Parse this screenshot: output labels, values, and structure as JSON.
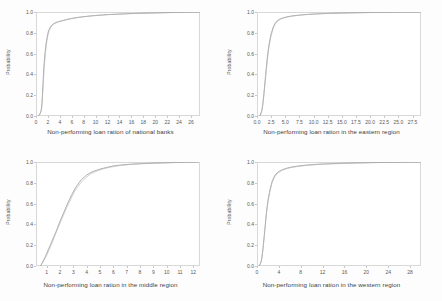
{
  "figure": {
    "background_color": "#fdfdfd",
    "panel_background_color": "#ffffff",
    "axis_color": "#d8d8d8",
    "curve_color": "#8a8a8a",
    "layout": "2x2 grid of cumulative distribution plots"
  },
  "chart_data": [
    {
      "type": "line",
      "title": "",
      "xlabel": "Non-performing loan ration of national banks",
      "ylabel": "Probability",
      "xlim": [
        0,
        27.5
      ],
      "ylim": [
        0.0,
        1.0
      ],
      "grid": false,
      "legend": "none",
      "xticks": [
        "0",
        "2",
        "4",
        "6",
        "8",
        "10",
        "12",
        "14",
        "16",
        "18",
        "20",
        "22",
        "24",
        "26"
      ],
      "xtick_values": [
        0,
        2,
        4,
        6,
        8,
        10,
        12,
        14,
        16,
        18,
        20,
        22,
        24,
        26
      ],
      "yticks": [
        "0.0",
        "0.2",
        "0.4",
        "0.6",
        "0.8",
        "1.0"
      ],
      "ytick_values": [
        0.0,
        0.2,
        0.4,
        0.6,
        0.8,
        1.0
      ],
      "series": [
        {
          "name": "empirical-cdf",
          "x": [
            0.4,
            0.7,
            0.9,
            1.0,
            1.1,
            1.2,
            1.3,
            1.5,
            1.7,
            1.9,
            2.1,
            2.4,
            2.7,
            3.0,
            3.4,
            3.8,
            4.3,
            5.0,
            6.0,
            7.0,
            8.5,
            10.0,
            12.0,
            14.0,
            16.0,
            18.0,
            20.0,
            22.0,
            24.0,
            26.0,
            27.5
          ],
          "y": [
            0.0,
            0.02,
            0.06,
            0.12,
            0.22,
            0.34,
            0.46,
            0.6,
            0.7,
            0.77,
            0.82,
            0.855,
            0.875,
            0.89,
            0.9,
            0.908,
            0.915,
            0.925,
            0.938,
            0.948,
            0.958,
            0.966,
            0.975,
            0.98,
            0.985,
            0.988,
            0.991,
            0.994,
            0.996,
            0.999,
            1.0
          ]
        },
        {
          "name": "fitted-cdf",
          "x": [
            0.4,
            0.8,
            1.0,
            1.2,
            1.4,
            1.6,
            1.9,
            2.2,
            2.6,
            3.1,
            3.7,
            4.4,
            5.3,
            6.5,
            8.0,
            10.0,
            12.5,
            15.0,
            18.0,
            21.0,
            24.0,
            27.5
          ],
          "y": [
            0.0,
            0.04,
            0.1,
            0.3,
            0.48,
            0.62,
            0.75,
            0.82,
            0.865,
            0.888,
            0.903,
            0.916,
            0.929,
            0.943,
            0.955,
            0.967,
            0.976,
            0.983,
            0.989,
            0.993,
            0.997,
            1.0
          ]
        }
      ]
    },
    {
      "type": "line",
      "title": "",
      "xlabel": "Non-performing loan ration in the eastern region",
      "ylabel": "Probability",
      "xlim": [
        0.0,
        29.0
      ],
      "ylim": [
        0.0,
        1.0
      ],
      "grid": false,
      "legend": "none",
      "xticks": [
        "0.0",
        "2.5",
        "5.0",
        "7.5",
        "10.0",
        "12.5",
        "15.0",
        "17.5",
        "20.0",
        "22.5",
        "25.0",
        "27.5"
      ],
      "xtick_values": [
        0.0,
        2.5,
        5.0,
        7.5,
        10.0,
        12.5,
        15.0,
        17.5,
        20.0,
        22.5,
        25.0,
        27.5
      ],
      "yticks": [
        "0.0",
        "0.2",
        "0.4",
        "0.6",
        "0.8",
        "1.0"
      ],
      "ytick_values": [
        0.0,
        0.2,
        0.4,
        0.6,
        0.8,
        1.0
      ],
      "series": [
        {
          "name": "empirical-cdf",
          "x": [
            0.5,
            0.8,
            1.0,
            1.2,
            1.5,
            1.8,
            2.1,
            2.5,
            2.9,
            3.3,
            3.8,
            4.4,
            5.2,
            6.2,
            7.5,
            9.0,
            11.0,
            13.0,
            15.0,
            18.0,
            21.0,
            24.0,
            27.0,
            29.0
          ],
          "y": [
            0.0,
            0.04,
            0.1,
            0.2,
            0.38,
            0.55,
            0.68,
            0.79,
            0.86,
            0.9,
            0.925,
            0.94,
            0.952,
            0.962,
            0.97,
            0.977,
            0.983,
            0.987,
            0.99,
            0.993,
            0.996,
            0.998,
            0.999,
            1.0
          ]
        },
        {
          "name": "fitted-cdf",
          "x": [
            0.5,
            0.9,
            1.1,
            1.4,
            1.7,
            2.0,
            2.4,
            2.8,
            3.2,
            3.7,
            4.3,
            5.0,
            6.0,
            7.2,
            8.8,
            11.0,
            13.5,
            16.5,
            20.0,
            24.0,
            29.0
          ],
          "y": [
            0.0,
            0.06,
            0.14,
            0.3,
            0.47,
            0.62,
            0.75,
            0.83,
            0.885,
            0.915,
            0.935,
            0.948,
            0.959,
            0.968,
            0.976,
            0.983,
            0.988,
            0.992,
            0.995,
            0.998,
            1.0
          ]
        }
      ]
    },
    {
      "type": "line",
      "title": "",
      "xlabel": "Non-performing loan ration in the middle region",
      "ylabel": "Probability",
      "xlim": [
        0.2,
        12.5
      ],
      "ylim": [
        0.0,
        1.0
      ],
      "grid": false,
      "legend": "none",
      "xticks": [
        "1",
        "2",
        "3",
        "4",
        "5",
        "6",
        "7",
        "8",
        "9",
        "10",
        "11",
        "12"
      ],
      "xtick_values": [
        1,
        2,
        3,
        4,
        5,
        6,
        7,
        8,
        9,
        10,
        11,
        12
      ],
      "yticks": [
        "0.0",
        "0.2",
        "0.4",
        "0.6",
        "0.8",
        "1.0"
      ],
      "ytick_values": [
        0.0,
        0.2,
        0.4,
        0.6,
        0.8,
        1.0
      ],
      "series": [
        {
          "name": "empirical-cdf",
          "x": [
            0.55,
            0.9,
            1.3,
            1.7,
            2.0,
            2.3,
            2.6,
            2.9,
            3.2,
            3.6,
            4.0,
            4.4,
            4.9,
            5.4,
            6.0,
            6.6,
            7.3,
            8.2,
            9.2,
            10.3,
            11.4,
            12.4
          ],
          "y": [
            0.0,
            0.09,
            0.21,
            0.33,
            0.43,
            0.52,
            0.61,
            0.69,
            0.76,
            0.83,
            0.875,
            0.905,
            0.928,
            0.945,
            0.962,
            0.972,
            0.979,
            0.985,
            0.99,
            0.994,
            0.998,
            1.0
          ]
        },
        {
          "name": "fitted-cdf",
          "x": [
            0.55,
            1.0,
            1.4,
            1.8,
            2.2,
            2.5,
            2.8,
            3.1,
            3.5,
            3.9,
            4.3,
            4.8,
            5.3,
            5.9,
            6.5,
            7.2,
            8.0,
            9.0,
            10.2,
            11.3,
            12.4
          ],
          "y": [
            0.0,
            0.1,
            0.22,
            0.35,
            0.47,
            0.56,
            0.64,
            0.72,
            0.79,
            0.845,
            0.885,
            0.915,
            0.937,
            0.953,
            0.966,
            0.975,
            0.982,
            0.988,
            0.993,
            0.997,
            1.0
          ]
        }
      ]
    },
    {
      "type": "line",
      "title": "",
      "xlabel": "Non-performing loan ration in the western region",
      "ylabel": "Probability",
      "xlim": [
        0,
        30
      ],
      "ylim": [
        0.0,
        1.0
      ],
      "grid": false,
      "legend": "none",
      "xticks": [
        "0",
        "4",
        "8",
        "12",
        "16",
        "20",
        "24",
        "28"
      ],
      "xtick_values": [
        0,
        4,
        8,
        12,
        16,
        20,
        24,
        28
      ],
      "yticks": [
        "0.0",
        "0.2",
        "0.4",
        "0.6",
        "0.8",
        "1.0"
      ],
      "ytick_values": [
        0.0,
        0.2,
        0.4,
        0.6,
        0.8,
        1.0
      ],
      "series": [
        {
          "name": "empirical-cdf",
          "x": [
            0.4,
            0.7,
            0.9,
            1.1,
            1.4,
            1.7,
            2.0,
            2.4,
            2.8,
            3.3,
            3.9,
            4.6,
            5.4,
            6.4,
            7.6,
            9.0,
            11.0,
            13.0,
            15.5,
            18.0,
            21.0,
            24.0,
            27.0,
            30.0
          ],
          "y": [
            0.0,
            0.03,
            0.08,
            0.17,
            0.33,
            0.5,
            0.63,
            0.74,
            0.82,
            0.875,
            0.905,
            0.925,
            0.94,
            0.952,
            0.962,
            0.97,
            0.978,
            0.983,
            0.988,
            0.991,
            0.994,
            0.996,
            0.998,
            1.0
          ]
        },
        {
          "name": "fitted-cdf",
          "x": [
            0.4,
            0.8,
            1.0,
            1.3,
            1.6,
            1.9,
            2.3,
            2.7,
            3.2,
            3.8,
            4.5,
            5.3,
            6.3,
            7.6,
            9.2,
            11.5,
            14.0,
            17.0,
            20.5,
            24.5,
            30.0
          ],
          "y": [
            0.0,
            0.05,
            0.12,
            0.27,
            0.44,
            0.58,
            0.7,
            0.79,
            0.855,
            0.895,
            0.918,
            0.934,
            0.947,
            0.958,
            0.968,
            0.977,
            0.983,
            0.988,
            0.993,
            0.997,
            1.0
          ]
        }
      ]
    }
  ]
}
